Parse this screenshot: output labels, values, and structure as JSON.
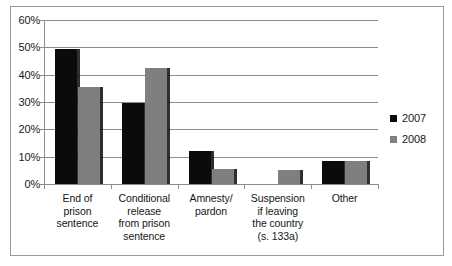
{
  "chart_data": {
    "type": "bar",
    "title": "",
    "xlabel": "",
    "ylabel": "",
    "ylim": [
      0,
      60
    ],
    "ytick_labels": [
      "0%",
      "10%",
      "20%",
      "30%",
      "40%",
      "50%",
      "60%"
    ],
    "ytick_values": [
      0,
      10,
      20,
      30,
      40,
      50,
      60
    ],
    "grid": true,
    "legend_position": "right",
    "categories": [
      "End of prison sentence",
      "Conditional release from prison sentence",
      "Amnesty/ pardon",
      "Suspension if leaving the country (s. 133a)",
      "Other"
    ],
    "category_lines": [
      [
        "End of",
        "prison",
        "sentence"
      ],
      [
        "Conditional",
        "release",
        "from prison",
        "sentence"
      ],
      [
        "Amnesty/",
        "pardon"
      ],
      [
        "Suspension",
        "if leaving",
        "the country",
        "(s. 133a)"
      ],
      [
        "Other"
      ]
    ],
    "series": [
      {
        "name": "2007",
        "color": "#0b0b0b",
        "values": [
          49.4,
          29.5,
          12.0,
          null,
          8.5
        ]
      },
      {
        "name": "2008",
        "color": "#7f7f7f",
        "values": [
          35.5,
          42.5,
          5.5,
          5.0,
          8.5
        ]
      }
    ]
  },
  "legend": {
    "items": [
      {
        "label": "2007",
        "color": "#0b0b0b"
      },
      {
        "label": "2008",
        "color": "#7f7f7f"
      }
    ]
  }
}
